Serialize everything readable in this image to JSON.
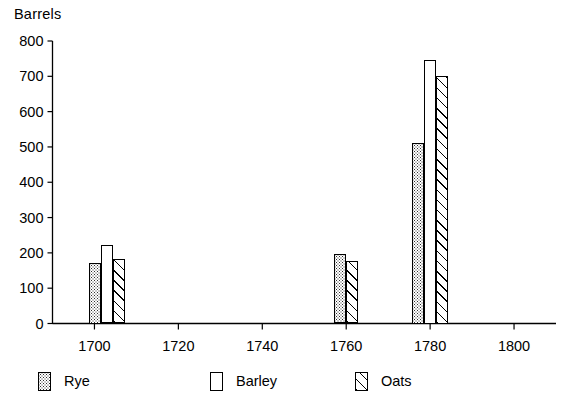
{
  "chart_data": {
    "type": "bar",
    "title": "",
    "subtitle": "",
    "xlabel": "",
    "ylabel": "Barrels",
    "x": [
      1703,
      1760,
      1780
    ],
    "categories": [
      "1703",
      "1760",
      "1780"
    ],
    "series": [
      {
        "name": "Rye",
        "values": [
          170,
          198,
          510
        ]
      },
      {
        "name": "Barley",
        "values": [
          223,
          null,
          745
        ]
      },
      {
        "name": "Oats",
        "values": [
          183,
          177,
          700
        ]
      }
    ],
    "xlim": [
      1690,
      1810
    ],
    "ylim": [
      0,
      800
    ],
    "xticks": [
      1700,
      1720,
      1740,
      1760,
      1780,
      1800
    ],
    "yticks": [
      0,
      100,
      200,
      300,
      400,
      500,
      600,
      700,
      800
    ],
    "xtick_labels": [
      "1700",
      "1720",
      "1740",
      "1760",
      "1780",
      "1800"
    ],
    "ytick_labels": [
      "0",
      "100",
      "200",
      "300",
      "400",
      "500",
      "600",
      "700",
      "800"
    ],
    "grid": false,
    "legend_position": "below",
    "legend": [
      "Rye",
      "Barley",
      "Oats"
    ]
  },
  "legend_items": [
    {
      "label": "Rye",
      "fill": "rye",
      "swatch_name": "legend-swatch-rye"
    },
    {
      "label": "Barley",
      "fill": "barley",
      "swatch_name": "legend-swatch-barley"
    },
    {
      "label": "Oats",
      "fill": "oats",
      "swatch_name": "legend-swatch-oats"
    }
  ],
  "colors": {
    "axis": "#000000",
    "text": "#000000",
    "background": "#ffffff",
    "rye_stipple": "#303030",
    "oats_hatch": "#000000",
    "barley_fill": "#ffffff"
  }
}
